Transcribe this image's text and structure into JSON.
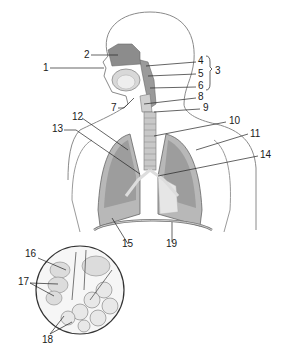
{
  "diagram": {
    "type": "anatomical",
    "labels": [
      {
        "id": "1",
        "text": "1",
        "x": 43,
        "y": 64
      },
      {
        "id": "2",
        "text": "2",
        "x": 84,
        "y": 50
      },
      {
        "id": "3",
        "text": "3",
        "x": 214,
        "y": 67
      },
      {
        "id": "4",
        "text": "4",
        "x": 198,
        "y": 57
      },
      {
        "id": "5",
        "text": "5",
        "x": 198,
        "y": 70
      },
      {
        "id": "6",
        "text": "6",
        "x": 198,
        "y": 82
      },
      {
        "id": "7",
        "text": "7",
        "x": 111,
        "y": 104
      },
      {
        "id": "8",
        "text": "8",
        "x": 198,
        "y": 93
      },
      {
        "id": "9",
        "text": "9",
        "x": 203,
        "y": 104
      },
      {
        "id": "10",
        "text": "10",
        "x": 229,
        "y": 117
      },
      {
        "id": "11",
        "text": "11",
        "x": 250,
        "y": 130
      },
      {
        "id": "12",
        "text": "12",
        "x": 73,
        "y": 113
      },
      {
        "id": "13",
        "text": "13",
        "x": 54,
        "y": 125
      },
      {
        "id": "14",
        "text": "14",
        "x": 260,
        "y": 151
      },
      {
        "id": "15",
        "text": "15",
        "x": 122,
        "y": 240
      },
      {
        "id": "16",
        "text": "16",
        "x": 26,
        "y": 250
      },
      {
        "id": "17",
        "text": "17",
        "x": 19,
        "y": 278
      },
      {
        "id": "18",
        "text": "18",
        "x": 42,
        "y": 336
      },
      {
        "id": "19",
        "text": "19",
        "x": 166,
        "y": 240
      }
    ]
  }
}
